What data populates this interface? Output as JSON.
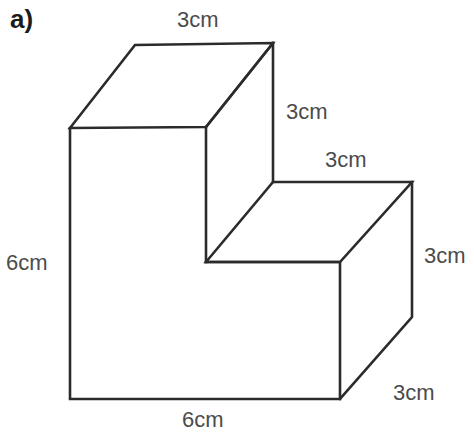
{
  "figure": {
    "part_label": "a)",
    "shape_name": "l-shaped-step-prism",
    "stroke_color": "#2b2b2b",
    "label_color": "#4b4b4b",
    "background_color": "#ffffff",
    "labels": {
      "top": "3cm",
      "upper_right": "3cm",
      "step_top": "3cm",
      "right": "3cm",
      "bottom_right": "3cm",
      "left": "6cm",
      "bottom": "6cm"
    },
    "dimensions": {
      "overall_height": "6cm",
      "overall_width": "6cm",
      "depth": "3cm",
      "step_width": "3cm",
      "step_height": "3cm",
      "upper_block_height": "3cm"
    }
  }
}
